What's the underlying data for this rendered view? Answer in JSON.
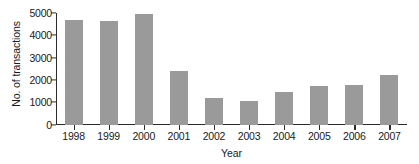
{
  "chart_data": {
    "type": "bar",
    "title": "",
    "xlabel": "Year",
    "ylabel": "No. of transactions",
    "categories": [
      "1998",
      "1999",
      "2000",
      "2001",
      "2002",
      "2003",
      "2004",
      "2005",
      "2006",
      "2007"
    ],
    "values": [
      4700,
      4650,
      4950,
      2400,
      1200,
      1050,
      1480,
      1730,
      1790,
      2230
    ],
    "series": [
      {
        "name": "No. of transactions",
        "values": [
          4700,
          4650,
          4950,
          2400,
          1200,
          1050,
          1480,
          1730,
          1790,
          2230
        ]
      }
    ],
    "ylim": [
      0,
      5000
    ],
    "yticks": [
      0,
      1000,
      2000,
      3000,
      4000,
      5000
    ],
    "ytick_labels": [
      "0",
      "1000",
      "2000",
      "3000",
      "4000",
      "5000"
    ],
    "grid": false,
    "legend": false,
    "legend_position": "none",
    "bar_color": "#9a9a9a",
    "axis_color": "#2b2b2b",
    "background_color": "#ffffff"
  }
}
